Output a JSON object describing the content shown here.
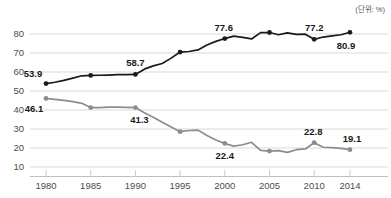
{
  "unit_note": "(단위: %)",
  "chart_data": {
    "type": "line",
    "title": "",
    "subtitle": "",
    "xlabel": "",
    "ylabel": "",
    "unit": "%",
    "grid": true,
    "legend_position": "none",
    "xlim": [
      1980,
      2014
    ],
    "ylim": [
      10,
      85
    ],
    "y_ticks": [
      10,
      20,
      30,
      40,
      50,
      60,
      70,
      80
    ],
    "x_ticks": [
      1980,
      1985,
      1990,
      1995,
      2000,
      2005,
      2010,
      2014
    ],
    "x": [
      1980,
      1981,
      1982,
      1983,
      1984,
      1985,
      1986,
      1987,
      1988,
      1989,
      1990,
      1991,
      1992,
      1993,
      1994,
      1995,
      1996,
      1997,
      1998,
      1999,
      2000,
      2001,
      2002,
      2003,
      2004,
      2005,
      2006,
      2007,
      2008,
      2009,
      2010,
      2011,
      2012,
      2013,
      2014
    ],
    "series": [
      {
        "name": "upper-line",
        "color": "#1a1a1a",
        "values": [
          53.9,
          54.6,
          55.6,
          56.8,
          58.0,
          58.2,
          58.3,
          58.4,
          58.6,
          58.6,
          58.7,
          61.5,
          63.2,
          64.5,
          67.3,
          70.5,
          70.8,
          71.6,
          74.2,
          76.1,
          77.6,
          78.9,
          78.2,
          77.4,
          80.7,
          80.8,
          79.6,
          80.6,
          79.8,
          79.9,
          77.2,
          78.4,
          79.0,
          79.6,
          80.9
        ],
        "labeled_points": [
          {
            "x": 1980,
            "y": 53.9,
            "label": "53.9"
          },
          {
            "x": 1990,
            "y": 58.7,
            "label": "58.7"
          },
          {
            "x": 2000,
            "y": 77.6,
            "label": "77.6"
          },
          {
            "x": 2010,
            "y": 77.2,
            "label": "77.2"
          },
          {
            "x": 2014,
            "y": 80.9,
            "label": "80.9"
          }
        ],
        "marker_years": [
          1980,
          1985,
          1990,
          1995,
          2000,
          2005,
          2010,
          2014
        ]
      },
      {
        "name": "lower-line",
        "color": "#8c8c8c",
        "values": [
          46.1,
          45.6,
          45.1,
          44.4,
          43.5,
          41.3,
          41.3,
          41.5,
          41.5,
          41.4,
          41.3,
          38.6,
          36.2,
          33.6,
          31.0,
          28.6,
          29.2,
          29.4,
          26.6,
          24.2,
          22.4,
          21.0,
          21.7,
          23.0,
          18.7,
          18.4,
          18.6,
          17.7,
          19.1,
          19.5,
          22.8,
          20.4,
          20.2,
          19.8,
          19.1
        ],
        "labeled_points": [
          {
            "x": 1980,
            "y": 46.1,
            "label": "46.1"
          },
          {
            "x": 1990,
            "y": 41.3,
            "label": "41.3"
          },
          {
            "x": 2000,
            "y": 22.4,
            "label": "22.4"
          },
          {
            "x": 2010,
            "y": 22.8,
            "label": "22.8"
          },
          {
            "x": 2014,
            "y": 19.1,
            "label": "19.1"
          }
        ],
        "marker_years": [
          1980,
          1985,
          1990,
          1995,
          2000,
          2005,
          2010,
          2014
        ]
      }
    ],
    "labels": {
      "y": [
        "80",
        "70",
        "60",
        "50",
        "40",
        "30",
        "20",
        "10"
      ],
      "x": [
        "1980",
        "1985",
        "1990",
        "1995",
        "2000",
        "2005",
        "2010",
        "2014"
      ]
    }
  },
  "colors": {
    "grid": "#d9d9d9",
    "axis_text": "#4d4d4d",
    "label_text": "#1a1a1a",
    "background": "#ffffff"
  }
}
